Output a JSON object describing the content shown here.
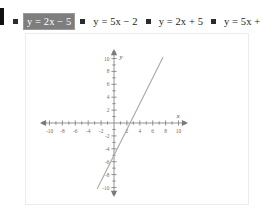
{
  "question": {
    "choices": [
      {
        "label": "y = 2x − 5",
        "selected": true
      },
      {
        "label": "y = 5x − 2",
        "selected": false
      },
      {
        "label": "y = 2x + 5",
        "selected": false
      },
      {
        "label": "y = 5x + 2",
        "selected": false
      }
    ],
    "selected_index": 0,
    "selected_bg": "#7e7e7e",
    "selected_fg": "#ffffff",
    "bullet_color": "#2b2b2b"
  },
  "chart_data": {
    "type": "line",
    "title": "",
    "xlabel": "x",
    "ylabel": "y",
    "xlim": [
      -11,
      11
    ],
    "ylim": [
      -11,
      11
    ],
    "xticks": [
      -10,
      -8,
      -6,
      -4,
      -2,
      2,
      4,
      6,
      8,
      10
    ],
    "yticks": [
      10,
      8,
      6,
      4,
      2,
      -2,
      -4,
      -6,
      -8,
      -10
    ],
    "xtick_labels": [
      "-10",
      "-8",
      "-6",
      "-4",
      "-2",
      "2",
      "4",
      "6",
      "8",
      "10"
    ],
    "ytick_labels": [
      "10",
      "8",
      "6",
      "4",
      "2",
      "-2",
      "-4",
      "-6",
      "-8",
      "-10"
    ],
    "minor_tick_step": 1,
    "grid": false,
    "legend": "none",
    "axis_color": "#7a7a7a",
    "line_color": "#a8a8a8",
    "series": [
      {
        "name": "y = 2x - 5",
        "slope": 2,
        "intercept": -5,
        "x_intercept": 2.5,
        "x": [
          -2.6,
          7.6
        ],
        "y": [
          -10.2,
          10.2
        ]
      }
    ]
  }
}
